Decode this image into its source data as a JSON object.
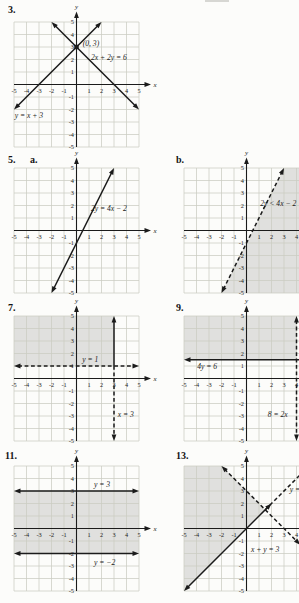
{
  "colors": {
    "paper": "#fcfcfa",
    "ink": "#1b1b1b",
    "grid": "#cbccc2",
    "shade": "rgba(100,100,92,0.18)"
  },
  "axis": {
    "x_label": "x",
    "y_label": "y",
    "tick_values": [
      -5,
      -4,
      -3,
      -2,
      -1,
      1,
      2,
      3,
      4,
      5
    ],
    "range": [
      -5,
      5
    ],
    "grid": true
  },
  "chart_data": [
    {
      "type": "line",
      "id": "problem-3",
      "number": "3.",
      "number_pos": {
        "x": 8,
        "y": 4
      },
      "pos": {
        "x": 0,
        "y": 0
      },
      "lines": [
        {
          "equation": "y = x + 3",
          "from": [
            -5,
            -2
          ],
          "to": [
            2,
            5
          ],
          "style": "solid",
          "arrow_start": true,
          "arrow_end": true
        },
        {
          "equation": "2x + 2y = 6",
          "from": [
            -2,
            5
          ],
          "to": [
            5,
            -2
          ],
          "style": "solid",
          "arrow_start": true,
          "arrow_end": true
        }
      ],
      "labels": [
        {
          "text": "(0, 3)",
          "x": 0.5,
          "y": 3.05
        },
        {
          "text": "2x + 2y = 6",
          "x": 1.15,
          "y": 1.95
        },
        {
          "text": "y = x + 3",
          "x": -4.95,
          "y": -2.7
        }
      ],
      "points": [
        {
          "x": 0,
          "y": 3,
          "label": "(0, 3)"
        }
      ]
    },
    {
      "type": "line",
      "id": "problem-5a",
      "number": "5.",
      "sub_number": "a.",
      "number_pos": {
        "x": 8,
        "y": 154
      },
      "sub_number_pos": {
        "x": 30,
        "y": 154
      },
      "pos": {
        "x": 0,
        "y": 146
      },
      "lines": [
        {
          "equation": "2y = 4x − 2",
          "from": [
            -2,
            -5
          ],
          "to": [
            3,
            5
          ],
          "style": "solid",
          "arrow_start": true,
          "arrow_end": true
        }
      ],
      "labels": [
        {
          "text": "2y = 4x − 2",
          "x": 1.15,
          "y": 1.55
        }
      ]
    },
    {
      "type": "line",
      "id": "problem-5b",
      "number": "b.",
      "number_pos": {
        "x": 176,
        "y": 154
      },
      "pos": {
        "x": 170,
        "y": 146
      },
      "lines": [
        {
          "equation": "2y < 4x − 2",
          "from": [
            -2,
            -5
          ],
          "to": [
            3,
            5
          ],
          "style": "dashed",
          "arrow_start": true,
          "arrow_end": true
        }
      ],
      "labels": [
        {
          "text": "2y < 4x − 2",
          "x": 1.1,
          "y": 1.95
        }
      ],
      "shade": [
        [
          -2,
          -5
        ],
        [
          3,
          5
        ],
        [
          5,
          5
        ],
        [
          5,
          -5
        ]
      ]
    },
    {
      "type": "line",
      "id": "problem-7",
      "number": "7.",
      "number_pos": {
        "x": 8,
        "y": 302
      },
      "pos": {
        "x": 0,
        "y": 294
      },
      "lines": [
        {
          "equation": "y = 1",
          "from": [
            -5,
            1
          ],
          "to": [
            5,
            1
          ],
          "style": "dashed",
          "arrow_start": true,
          "arrow_end": true
        },
        {
          "equation": "x = 3",
          "from": [
            3,
            1
          ],
          "to": [
            3,
            5
          ],
          "style": "solid",
          "arrow_end": true
        },
        {
          "equation": "x = 3",
          "from": [
            3,
            1
          ],
          "to": [
            3,
            -5
          ],
          "style": "dashed",
          "arrow_end": true
        }
      ],
      "labels": [
        {
          "text": "y = 1",
          "x": 0.45,
          "y": 1.3
        },
        {
          "text": "x = 3",
          "x": 3.3,
          "y": -3.05
        }
      ],
      "shade": [
        [
          -5,
          1
        ],
        [
          3,
          1
        ],
        [
          3,
          5
        ],
        [
          -5,
          5
        ]
      ]
    },
    {
      "type": "line",
      "id": "problem-9",
      "number": "9.",
      "number_pos": {
        "x": 176,
        "y": 302
      },
      "pos": {
        "x": 170,
        "y": 294
      },
      "lines": [
        {
          "equation": "4y = 6",
          "from": [
            -5,
            1.5
          ],
          "to": [
            5,
            1.5
          ],
          "style": "solid",
          "arrow_start": true,
          "arrow_end": true
        },
        {
          "equation": "8 = 2x",
          "from": [
            4,
            5
          ],
          "to": [
            4,
            -5
          ],
          "style": "dashed",
          "arrow_start": true,
          "arrow_end": true
        }
      ],
      "labels": [
        {
          "text": "4y = 6",
          "x": -3.95,
          "y": 0.75
        },
        {
          "text": "8 = 2x",
          "x": 1.7,
          "y": -3.05
        }
      ],
      "shade": [
        [
          -5,
          1.5
        ],
        [
          4,
          1.5
        ],
        [
          4,
          5
        ],
        [
          -5,
          5
        ]
      ]
    },
    {
      "type": "line",
      "id": "problem-11",
      "number": "11.",
      "number_pos": {
        "x": 5,
        "y": 450
      },
      "pos": {
        "x": 0,
        "y": 444
      },
      "lines": [
        {
          "equation": "y = 3",
          "from": [
            -5,
            3
          ],
          "to": [
            5,
            3
          ],
          "style": "solid",
          "arrow_start": true,
          "arrow_end": true
        },
        {
          "equation": "y = −2",
          "from": [
            -5,
            -2
          ],
          "to": [
            5,
            -2
          ],
          "style": "solid",
          "arrow_start": true,
          "arrow_end": true
        }
      ],
      "labels": [
        {
          "text": "y = 3",
          "x": 1.4,
          "y": 3.35
        },
        {
          "text": "y = −2",
          "x": 1.4,
          "y": -2.95
        }
      ],
      "shade": [
        [
          -5,
          -2
        ],
        [
          5,
          -2
        ],
        [
          5,
          3
        ],
        [
          -5,
          3
        ]
      ]
    },
    {
      "type": "line",
      "id": "problem-13",
      "number": "13.",
      "number_pos": {
        "x": 176,
        "y": 450
      },
      "pos": {
        "x": 170,
        "y": 444
      },
      "lines": [
        {
          "equation": "y = x",
          "from": [
            -5,
            -5
          ],
          "to": [
            2,
            2
          ],
          "style": "solid",
          "arrow_start": true,
          "arrow_end": true
        },
        {
          "equation": "y = x",
          "from": [
            1.5,
            1.5
          ],
          "to": [
            5,
            5
          ],
          "style": "dashed",
          "arrow_end": true
        },
        {
          "equation": "x + y = 3",
          "from": [
            -2,
            5
          ],
          "to": [
            4.3,
            -1.3
          ],
          "style": "dashed",
          "arrow_start": true,
          "arrow_end": true
        }
      ],
      "labels": [
        {
          "text": "x + y = 3",
          "x": 0.35,
          "y": -1.85
        },
        {
          "text": "y = x",
          "x": 3.45,
          "y": 2.95
        }
      ],
      "shade": [
        [
          1.5,
          1.5
        ],
        [
          -5,
          -5
        ],
        [
          -5,
          5
        ],
        [
          -2,
          5
        ]
      ]
    }
  ]
}
